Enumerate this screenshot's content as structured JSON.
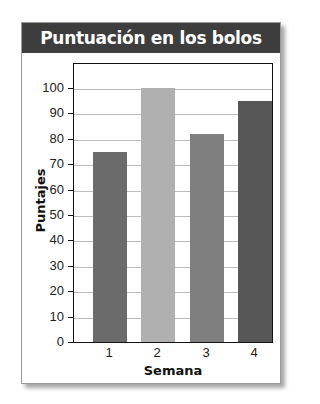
{
  "chart_data": {
    "type": "bar",
    "title": "Puntuación en los bolos",
    "xlabel": "Semana",
    "ylabel": "Puntajes",
    "categories": [
      "1",
      "2",
      "3",
      "4"
    ],
    "values": [
      75,
      100,
      82,
      95
    ],
    "ylim": [
      0,
      110
    ],
    "yticks": [
      0,
      10,
      20,
      30,
      40,
      50,
      60,
      70,
      80,
      90,
      100
    ],
    "grid": true,
    "legend": null,
    "bar_colors": [
      "#6b6b6b",
      "#b0b0b0",
      "#7f7f7f",
      "#575757"
    ]
  },
  "colors": {
    "header_bg": "#3d3d3d",
    "header_text": "#ffffff",
    "gridline": "#bdbdbd"
  }
}
